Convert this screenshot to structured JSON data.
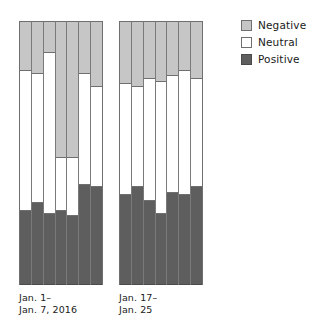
{
  "legend": {
    "position": "top-right",
    "items": [
      {
        "label": "Negative",
        "color": "#c6c6c6",
        "swatch": "negative-swatch"
      },
      {
        "label": "Neutral",
        "color": "#ffffff",
        "swatch": "neutral-swatch"
      },
      {
        "label": "Positive",
        "color": "#5e5e5e",
        "swatch": "positive-swatch"
      }
    ]
  },
  "groups": [
    {
      "caption": "Jan. 1–\nJan. 7, 2016"
    },
    {
      "caption": "Jan. 17–\nJan. 25"
    }
  ],
  "chart_data": {
    "type": "bar",
    "subtype": "stacked-percent",
    "title": "",
    "xlabel": "",
    "ylabel": "",
    "ylim": [
      0,
      100
    ],
    "grid": false,
    "stack_order": [
      "Positive",
      "Neutral",
      "Negative"
    ],
    "legend_position": "top-right",
    "colors": {
      "Negative": "#c6c6c6",
      "Neutral": "#ffffff",
      "Positive": "#5e5e5e"
    },
    "groups": [
      {
        "name": "Jan. 1–Jan. 7, 2016",
        "categories": [
          "1",
          "2",
          "3",
          "4",
          "5",
          "6",
          "7"
        ],
        "series": [
          {
            "name": "Positive",
            "values": [
              28,
              31,
              27,
              28,
              26,
              38,
              37
            ]
          },
          {
            "name": "Neutral",
            "values": [
              53,
              49,
              61,
              20,
              22,
              42,
              38
            ]
          },
          {
            "name": "Negative",
            "values": [
              19,
              20,
              12,
              52,
              52,
              20,
              25
            ]
          }
        ]
      },
      {
        "name": "Jan. 17–Jan. 25",
        "categories": [
          "1",
          "2",
          "3",
          "4",
          "5",
          "6",
          "7"
        ],
        "series": [
          {
            "name": "Positive",
            "values": [
              34,
              37,
              32,
              27,
              35,
              34,
              37
            ]
          },
          {
            "name": "Neutral",
            "values": [
              42,
              38,
              46,
              50,
              44,
              47,
              41
            ]
          },
          {
            "name": "Negative",
            "values": [
              24,
              25,
              22,
              23,
              21,
              19,
              22
            ]
          }
        ]
      }
    ]
  }
}
